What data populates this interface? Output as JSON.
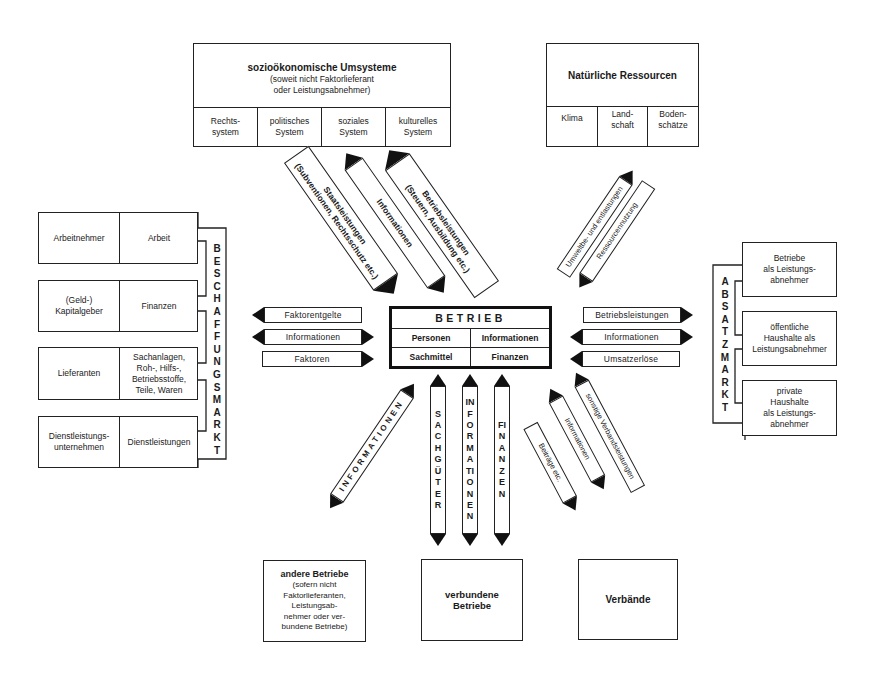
{
  "center": {
    "title": "BETRIEB",
    "cells": [
      "Personen",
      "Informationen",
      "Sachmittel",
      "Finanzen"
    ]
  },
  "top_left_box": {
    "title": "sozioökonomische Umsysteme",
    "subtitle": "(soweit nicht Faktorlieferant\noder Leistungsabnehmer)",
    "cells": [
      "Rechts-\nsystem",
      "politisches\nSystem",
      "soziales\nSystem",
      "kulturelles\nSystem"
    ]
  },
  "top_right_box": {
    "title": "Natürliche Ressourcen",
    "cells": [
      "Klima",
      "Land-\nschaft",
      "Boden-\nschätze"
    ]
  },
  "top_left_arrows": [
    {
      "label": "Staatsleistungen\n(Subventionen, Rechtsschutz etc.)",
      "direction": "to-betrieb"
    },
    {
      "label": "Informationen",
      "direction": "both"
    },
    {
      "label": "Betriebsleistungen\n(Steuern, Ausbildung etc.)",
      "direction": "to-umsysteme"
    }
  ],
  "top_right_arrows": [
    {
      "label": "Umweltbe- und entlastungen",
      "direction": "both"
    },
    {
      "label": "Ressourcennutzung",
      "direction": "to-ressourcen"
    }
  ],
  "beschaffungsmarkt": {
    "label": "BESCHAFFUNGSMARKT",
    "rows": [
      {
        "supplier": "Arbeitnehmer",
        "good": "Arbeit"
      },
      {
        "supplier": "(Geld-)\nKapitalgeber",
        "good": "Finanzen"
      },
      {
        "supplier": "Lieferanten",
        "good": "Sachanlagen,\nRoh-, Hilfs-,\nBetriebsstoffe,\nTeile, Waren"
      },
      {
        "supplier": "Dienstleistungs-\nunternehmen",
        "good": "Dienstleistungen"
      }
    ]
  },
  "left_arrows": [
    {
      "label": "Faktorentgelte",
      "direction": "left"
    },
    {
      "label": "Informationen",
      "direction": "both"
    },
    {
      "label": "Faktoren",
      "direction": "right"
    }
  ],
  "right_arrows": [
    {
      "label": "Betriebsleistungen",
      "direction": "right"
    },
    {
      "label": "Informationen",
      "direction": "both"
    },
    {
      "label": "Umsatzerlöse",
      "direction": "left"
    }
  ],
  "absatzmarkt": {
    "label": "ABSATZMARKT",
    "rows": [
      "Betriebe\nals Leistungs-\nabnehmer",
      "öffentliche\nHaushalte als\nLeistungsabnehmer",
      "private\nHaushalte\nals Leistungs-\nabnehmer"
    ]
  },
  "bottom_arrows": {
    "diagonal_left": {
      "label": "INFORMATIONEN",
      "direction": "both"
    },
    "vertical": [
      {
        "label": "SACHGÜTER",
        "direction": "both"
      },
      {
        "label": "INFORMATIONEN",
        "direction": "both"
      },
      {
        "label": "FINANZEN",
        "direction": "both"
      }
    ],
    "diagonal_right": [
      {
        "label": "Beiträge etc.",
        "direction": "to-verbaende"
      },
      {
        "label": "Informationen",
        "direction": "both"
      },
      {
        "label": "sonstige Verbandsleistungen",
        "direction": "to-betrieb"
      }
    ]
  },
  "bottom_boxes": {
    "andere": {
      "title": "andere Betriebe",
      "subtitle": "(sofern nicht\nFaktorlieferanten,\nLeistungsab-\nnehmer oder ver-\nbundene Betriebe)"
    },
    "verbundene": {
      "title": "verbundene\nBetriebe"
    },
    "verbaende": {
      "title": "Verbände"
    }
  }
}
